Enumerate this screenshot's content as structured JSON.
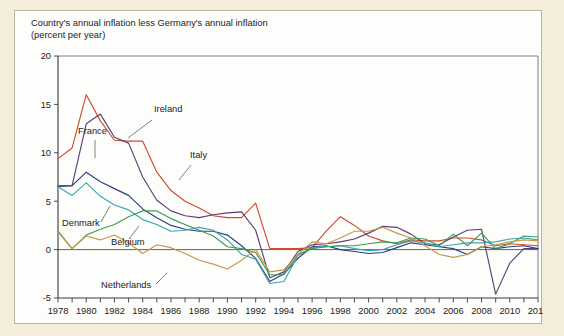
{
  "figure": {
    "title_line1": "Country's annual inflation less Germany's annual inflation",
    "title_line2": "(percent per year)",
    "background_color": "#f4edd9",
    "panel_color": "#fdfdfb"
  },
  "chart_data": {
    "type": "line",
    "title": "Country's annual inflation less Germany's annual inflation (percent per year)",
    "xlabel": "",
    "ylabel": "",
    "xlim": [
      1978,
      2012
    ],
    "ylim": [
      -5,
      20
    ],
    "yticks": [
      -5,
      0,
      5,
      10,
      15,
      20
    ],
    "ytick_labels": [
      "-5",
      "0",
      "5",
      "10",
      "15",
      "20"
    ],
    "xticks": [
      1978,
      1979,
      1980,
      1981,
      1982,
      1983,
      1984,
      1985,
      1986,
      1987,
      1988,
      1989,
      1990,
      1991,
      1992,
      1993,
      1994,
      1995,
      1996,
      1997,
      1998,
      1999,
      2000,
      2001,
      2002,
      2003,
      2004,
      2005,
      2006,
      2007,
      2008,
      2009,
      2010,
      2011,
      2012
    ],
    "xtick_labels": [
      "1978",
      "1980",
      "1982",
      "1984",
      "1986",
      "1988",
      "1990",
      "1992",
      "1994",
      "1996",
      "1998",
      "2000",
      "2002",
      "2004",
      "2006",
      "2008",
      "2010",
      "2012"
    ],
    "xtick_label_years": [
      1978,
      1980,
      1982,
      1984,
      1986,
      1988,
      1990,
      1992,
      1994,
      1996,
      1998,
      2000,
      2002,
      2004,
      2006,
      2008,
      2010,
      2012
    ],
    "grid": false,
    "legend_position": "inline-annotations",
    "zero_reference_line": 0,
    "x": [
      1978,
      1979,
      1980,
      1981,
      1982,
      1983,
      1984,
      1985,
      1986,
      1987,
      1988,
      1989,
      1990,
      1991,
      1992,
      1993,
      1994,
      1995,
      1996,
      1997,
      1998,
      1999,
      2000,
      2001,
      2002,
      2003,
      2004,
      2005,
      2006,
      2007,
      2008,
      2009,
      2010,
      2011,
      2012
    ],
    "series": [
      {
        "name": "Ireland",
        "color": "#cf4b33",
        "values": [
          9.4,
          10.5,
          16.0,
          13.3,
          11.3,
          11.2,
          11.2,
          8.0,
          6.1,
          5.0,
          4.3,
          3.5,
          3.3,
          3.3,
          4.8,
          0.1,
          0.1,
          0.1,
          0.2,
          1.9,
          3.4,
          2.5,
          1.4,
          0.9,
          0.6,
          1.0,
          0.9,
          0.9,
          1.2,
          1.2,
          1.0,
          0.4,
          0.6,
          0.5,
          0.4
        ]
      },
      {
        "name": "Italy",
        "color": "#5c3f78",
        "values": [
          6.5,
          6.6,
          13.0,
          14.0,
          11.6,
          11.0,
          7.5,
          5.1,
          4.0,
          3.5,
          3.3,
          3.6,
          3.8,
          3.9,
          2.0,
          -2.9,
          -2.3,
          -0.2,
          0.5,
          0.6,
          0.8,
          1.1,
          1.7,
          2.4,
          2.3,
          1.6,
          0.6,
          0.5,
          1.3,
          2.0,
          2.1,
          -4.6,
          -1.4,
          0.1,
          0.1
        ]
      },
      {
        "name": "France",
        "color": "#2c3f84",
        "values": [
          6.6,
          6.6,
          8.0,
          7.0,
          6.3,
          5.6,
          4.2,
          3.3,
          2.5,
          2.1,
          1.9,
          1.9,
          1.5,
          0.4,
          -0.9,
          -3.3,
          -2.5,
          -0.9,
          0.3,
          0.4,
          0.0,
          -0.2,
          -0.4,
          -0.3,
          0.2,
          0.7,
          0.5,
          0.3,
          0.1,
          -0.5,
          0.3,
          0.1,
          0.3,
          0.4,
          0.1
        ]
      },
      {
        "name": "Denmark",
        "color": "#3aa6b4",
        "values": [
          6.5,
          5.6,
          6.9,
          5.5,
          4.6,
          4.1,
          3.1,
          2.6,
          1.9,
          2.0,
          2.3,
          2.0,
          1.0,
          -0.5,
          -1.0,
          -3.5,
          -3.3,
          -0.6,
          0.2,
          0.3,
          0.4,
          0.1,
          -0.1,
          0.0,
          0.5,
          0.9,
          0.7,
          0.3,
          0.5,
          0.7,
          0.7,
          0.8,
          1.1,
          1.2,
          1.0
        ]
      },
      {
        "name": "Belgium",
        "color": "#3e9c55",
        "values": [
          1.9,
          0.1,
          1.5,
          2.1,
          2.6,
          3.4,
          4.0,
          4.0,
          3.2,
          2.6,
          2.0,
          1.4,
          0.3,
          0.1,
          -0.3,
          -2.6,
          -2.6,
          -0.5,
          0.1,
          0.3,
          0.4,
          0.4,
          0.6,
          0.8,
          0.7,
          1.2,
          1.1,
          0.4,
          1.6,
          0.4,
          1.7,
          0.1,
          0.6,
          1.4,
          1.3
        ]
      },
      {
        "name": "Netherlands",
        "color": "#c49a4a",
        "values": [
          1.8,
          0.1,
          1.4,
          1.0,
          1.5,
          0.7,
          -0.4,
          0.5,
          0.2,
          -0.4,
          -1.1,
          -1.5,
          -2.0,
          -1.1,
          0.0,
          -2.3,
          -2.1,
          -0.5,
          0.8,
          0.6,
          1.2,
          1.9,
          1.9,
          2.3,
          1.7,
          1.2,
          0.4,
          -0.5,
          -0.8,
          -0.5,
          0.3,
          0.5,
          0.8,
          1.0,
          0.9
        ]
      }
    ],
    "annotations": [
      {
        "label": "Ireland",
        "x_px": 139,
        "y_px": 101,
        "leader_from": [
          137,
          109
        ],
        "leader_to": [
          113,
          127
        ],
        "series": "Ireland"
      },
      {
        "label": "Italy",
        "x_px": 175,
        "y_px": 147,
        "leader_from": [
          176,
          154
        ],
        "leader_to": [
          164,
          169
        ],
        "series": "Italy"
      },
      {
        "label": "France",
        "x_px": 63,
        "y_px": 123,
        "leader_from": [
          80,
          129
        ],
        "leader_to": [
          80,
          147
        ],
        "series": "France"
      },
      {
        "label": "Denmark",
        "x_px": 47,
        "y_px": 215,
        "leader_from": [
          86,
          211
        ],
        "leader_to": [
          95,
          195
        ],
        "series": "Denmark"
      },
      {
        "label": "Belgium",
        "x_px": 96,
        "y_px": 234,
        "leader_from": [
          114,
          228
        ],
        "leader_to": [
          124,
          215
        ],
        "series": "Belgium"
      },
      {
        "label": "Netherlands",
        "x_px": 86,
        "y_px": 277,
        "leader_from": [
          141,
          273
        ],
        "leader_to": [
          152,
          262
        ],
        "series": "Netherlands"
      }
    ]
  }
}
